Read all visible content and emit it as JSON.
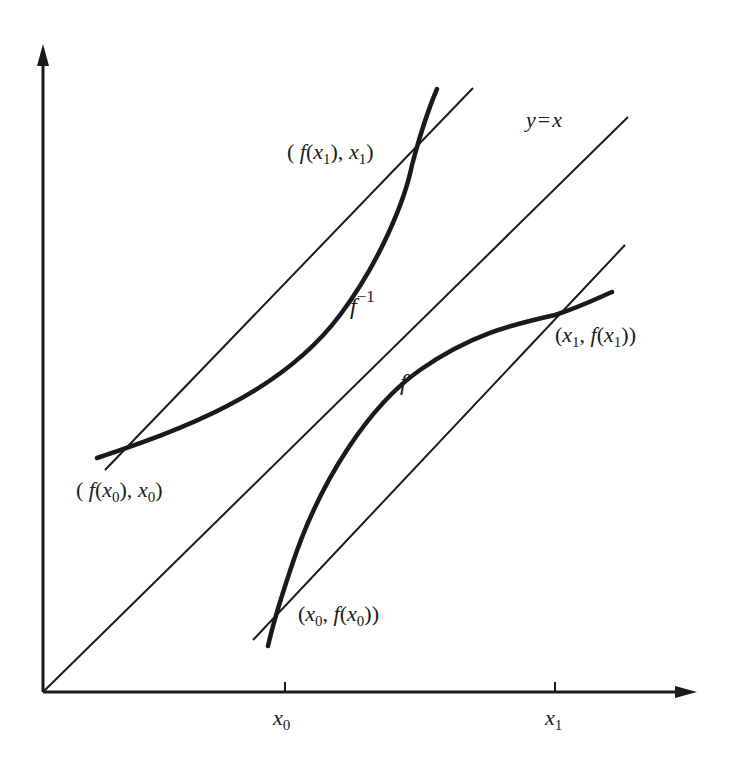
{
  "diagram": {
    "type": "function-inverse-reflection",
    "axes": {
      "x_axis": {
        "ticks": [
          {
            "label": "x",
            "sub": "0"
          },
          {
            "label": "x",
            "sub": "1"
          }
        ]
      },
      "y_axis": {
        "ticks": []
      }
    },
    "lines": {
      "identity": {
        "label": "y = x",
        "label_y": "y",
        "label_eq": "=",
        "label_x": "x"
      }
    },
    "curves": {
      "f": {
        "label": "f"
      },
      "f_inverse": {
        "label": "f",
        "label_sup": "−1"
      }
    },
    "points": [
      {
        "id": "p_f_x0",
        "text": "(x0, f(x0))",
        "parts": [
          "(",
          "x",
          "0",
          ", ",
          "f",
          "(",
          "x",
          "0",
          "))"
        ]
      },
      {
        "id": "p_f_x1",
        "text": "(x1, f(x1))",
        "parts": [
          "(",
          "x",
          "1",
          ", ",
          "f",
          "(",
          "x",
          "1",
          "))"
        ]
      },
      {
        "id": "p_finv_x0",
        "text": "(f(x0), x0)",
        "parts": [
          "( ",
          "f",
          "(",
          "x",
          "0",
          "), ",
          "x",
          "0",
          ")"
        ]
      },
      {
        "id": "p_finv_x1",
        "text": "(f(x1), x1)",
        "parts": [
          "( ",
          "f",
          "(",
          "x",
          "1",
          "), ",
          "x",
          "1",
          ")"
        ]
      }
    ],
    "colors": {
      "ink": "#1a1a1a",
      "background": "#ffffff"
    }
  }
}
